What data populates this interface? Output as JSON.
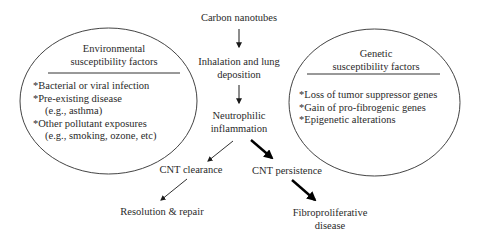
{
  "diagram": {
    "flow": {
      "carbon_nanotubes": "Carbon nanotubes",
      "inhalation_line1": "Inhalation and lung",
      "inhalation_line2": "deposition",
      "inflammation_line1": "Neutrophilic",
      "inflammation_line2": "inflammation",
      "clearance": "CNT clearance",
      "persistence": "CNT persistence",
      "resolution": "Resolution & repair",
      "fibro_line1": "Fibroproliferative",
      "fibro_line2": "disease"
    },
    "environmental": {
      "title_line1": "Environmental",
      "title_line2": "susceptibility factors",
      "items": [
        "*Bacterial or viral infection",
        "*Pre-existing disease",
        "(e.g., asthma)",
        "*Other pollutant exposures",
        "(e.g., smoking, ozone, etc)"
      ]
    },
    "genetic": {
      "title_line1": "Genetic",
      "title_line2": "susceptibility factors",
      "items": [
        "*Loss of tumor suppressor genes",
        "*Gain of pro-fibrogenic genes",
        "*Epigenetic alterations"
      ]
    },
    "colors": {
      "text": "#2a2a2a",
      "lines": "#333333",
      "background": "#ffffff"
    }
  }
}
